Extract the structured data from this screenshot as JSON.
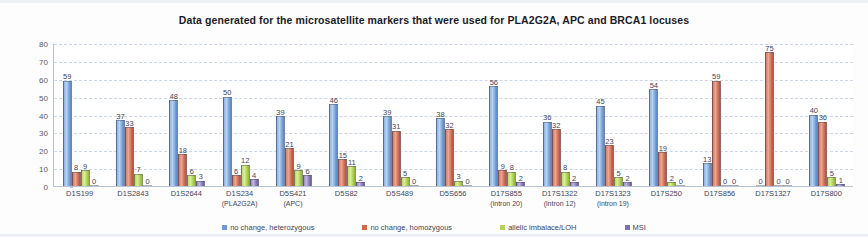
{
  "chart_data": {
    "type": "bar",
    "title": "Data generated for  the  microsatellite markers that were used for PLA2G2A, APC and BRCA1  locuses",
    "xlabel": "",
    "ylabel": "",
    "ylim": [
      0,
      80
    ],
    "ytick_step": 10,
    "yticks": [
      80,
      70,
      60,
      50,
      40,
      30,
      20,
      10,
      0
    ],
    "grid": true,
    "legend_position": "bottom",
    "categories": [
      "D1S199",
      "D1S2843",
      "D1S2644",
      "D1S234",
      "D5S421",
      "D5S82",
      "D5S489",
      "D5S656",
      "D17S855",
      "D17S1322",
      "D17S1323",
      "D17S250",
      "D17S856",
      "D17S1327",
      "D17S800"
    ],
    "category_sublabels": [
      "",
      "",
      "",
      "(PLA2G2A)",
      "(APC)",
      "",
      "",
      "",
      "(intron 20)",
      "(intron 12)",
      "(intron 19)",
      "",
      "",
      "",
      ""
    ],
    "series": [
      {
        "name": "no change, heterozygous",
        "color": "#6f9ad6",
        "values": [
          59,
          37,
          48,
          50,
          39,
          46,
          39,
          38,
          56,
          36,
          45,
          54,
          13,
          0,
          40
        ]
      },
      {
        "name": "no change, homozygous",
        "color": "#d2674a",
        "values": [
          8,
          33,
          18,
          6,
          21,
          15,
          31,
          32,
          9,
          32,
          23,
          19,
          59,
          75,
          36
        ]
      },
      {
        "name": "allelic imbalace/LOH",
        "color": "#b5d25f",
        "values": [
          9,
          7,
          6,
          12,
          9,
          11,
          5,
          3,
          8,
          8,
          5,
          2,
          0,
          0,
          5
        ]
      },
      {
        "name": "MSI",
        "color": "#8070b4",
        "values": [
          0,
          0,
          3,
          4,
          6,
          2,
          0,
          0,
          2,
          2,
          2,
          0,
          0,
          0,
          1
        ]
      }
    ]
  }
}
